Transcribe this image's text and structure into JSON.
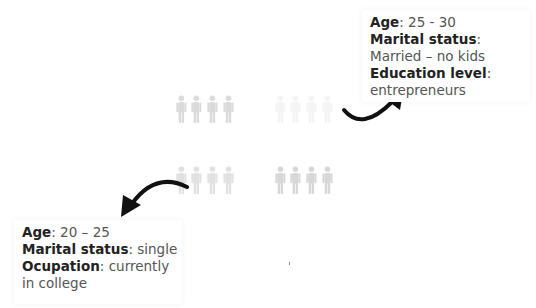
{
  "persona_top": {
    "age_label": "Age",
    "age_value": ": 25 - 30",
    "marital_label": "Marital status",
    "marital_sep": ":",
    "marital_value": "Married – no kids",
    "education_label": "Education level",
    "education_sep": ":",
    "education_value": "entrepreneurs"
  },
  "persona_bottom": {
    "age_label": "Age",
    "age_value": ": 20 – 25",
    "marital_label": "Marital status",
    "marital_value": ": single",
    "occupation_label": "Ocupation",
    "occupation_value": ": currently",
    "occupation_value2": "in college"
  },
  "groups": [
    {
      "id": "top-left",
      "opacity": 0.55
    },
    {
      "id": "top-right",
      "opacity": 0.15
    },
    {
      "id": "bottom-left",
      "opacity": 0.45
    },
    {
      "id": "bottom-right",
      "opacity": 0.6
    }
  ],
  "colors": {
    "figure": "#bdbdbd",
    "arrow": "#111111"
  }
}
